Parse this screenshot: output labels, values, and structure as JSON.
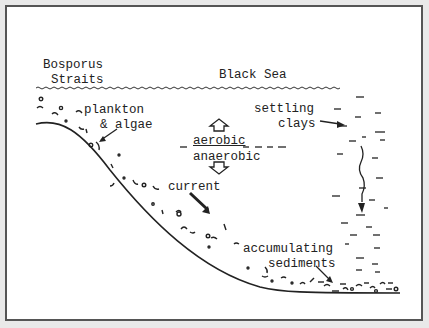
{
  "diagram": {
    "labels": {
      "bosporus_line1": "Bosporus",
      "bosporus_line2": "Straits",
      "black_sea": "Black Sea",
      "plankton_line1": "plankton",
      "plankton_line2": "& algae",
      "aerobic": "aerobic",
      "anaerobic": "anaerobic",
      "current": "current",
      "settling_line1": "settling",
      "settling_line2": "clays",
      "accumulating_line1": "accumulating",
      "accumulating_line2": "sediments"
    },
    "colors": {
      "ink": "#222222",
      "frame": "#555555",
      "background": "#ffffff"
    }
  }
}
